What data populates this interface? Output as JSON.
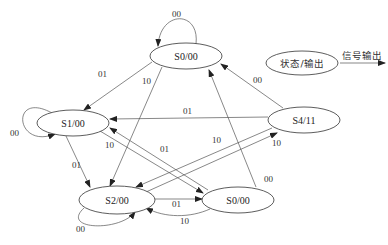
{
  "diagram": {
    "type": "state-machine",
    "nodes": [
      {
        "id": "S0_top",
        "label": "S0/00",
        "cx": 186,
        "cy": 56,
        "rx": 36,
        "ry": 13
      },
      {
        "id": "S1",
        "label": "S1/00",
        "cx": 73,
        "cy": 123,
        "rx": 36,
        "ry": 13
      },
      {
        "id": "S4",
        "label": "S4/11",
        "cx": 304,
        "cy": 120,
        "rx": 36,
        "ry": 13
      },
      {
        "id": "S2",
        "label": "S2/00",
        "cx": 117,
        "cy": 200,
        "rx": 38,
        "ry": 14
      },
      {
        "id": "S0_bottom",
        "label": "S0/00",
        "cx": 238,
        "cy": 200,
        "rx": 36,
        "ry": 13
      }
    ],
    "edges": [
      {
        "from": "S0_top",
        "to": "S0_top",
        "label": "00"
      },
      {
        "from": "S0_top",
        "to": "S1",
        "label": "01"
      },
      {
        "from": "S0_top",
        "to": "S2",
        "label": "10"
      },
      {
        "from": "S1",
        "to": "S1",
        "label": "00"
      },
      {
        "from": "S1",
        "to": "S2",
        "label": "01"
      },
      {
        "from": "S1",
        "to": "S0_bottom",
        "label": "10"
      },
      {
        "from": "S4",
        "to": "S1",
        "label": "01"
      },
      {
        "from": "S4",
        "to": "S0_top",
        "label": "00"
      },
      {
        "from": "S4",
        "to": "S2",
        "label": "10"
      },
      {
        "from": "S2",
        "to": "S2",
        "label": "00"
      },
      {
        "from": "S2",
        "to": "S4",
        "label": "10"
      },
      {
        "from": "S2",
        "to": "S0_bottom",
        "label": "01"
      },
      {
        "from": "S0_bottom",
        "to": "S1",
        "label": "01"
      },
      {
        "from": "S0_bottom",
        "to": "S2",
        "label": "10"
      },
      {
        "from": "S0_bottom",
        "to": "S0_top",
        "label": "00"
      }
    ],
    "legend": {
      "node_label": "状态/输出",
      "arrow_label": "信号输出"
    }
  }
}
